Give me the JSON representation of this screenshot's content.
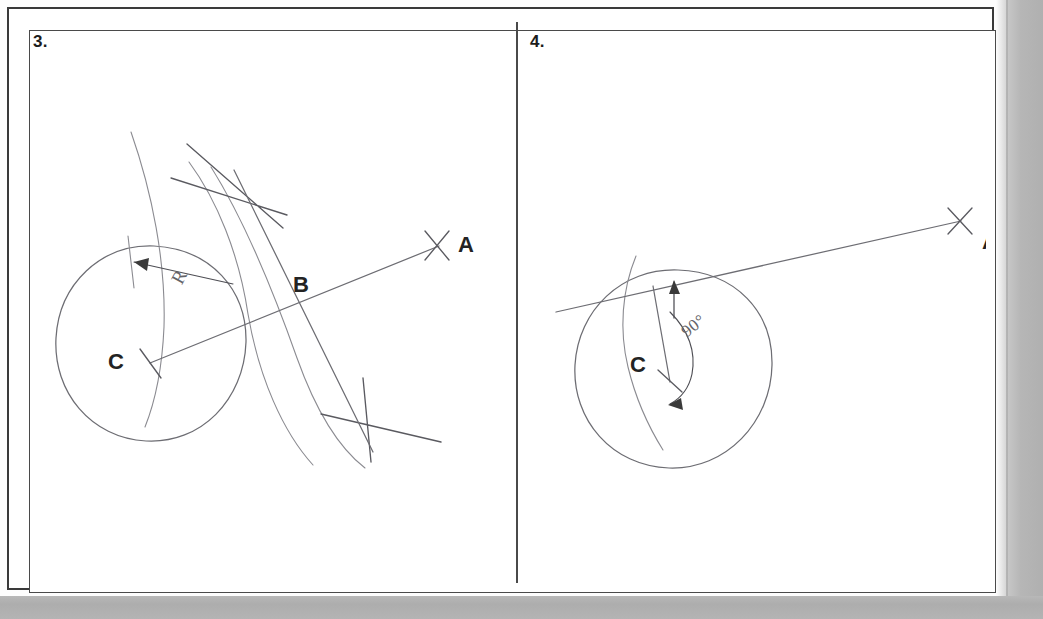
{
  "document": {
    "type": "technical-drawing-worksheet",
    "title": "Tangent line construction from external point to circle",
    "ink_color": "#6d6d73",
    "label_color": "#232323",
    "frame_color": "#3a3a3a",
    "page_background": "#fdfdfd",
    "scanner_bed_color": "#b4b4b4"
  },
  "panels": [
    {
      "id": "panel-3",
      "number": "3.",
      "labels": {
        "point_a": "A",
        "point_b": "B",
        "point_c": "C",
        "radius": "R"
      },
      "geometry": {
        "circle": {
          "cx": 150,
          "cy": 342,
          "r": 96
        },
        "point_a": {
          "x": 418,
          "y": 224
        },
        "point_b": {
          "x": 289,
          "y": 284
        },
        "point_c": {
          "x": 150,
          "y": 342
        },
        "arc_intersection_upper": {
          "x": 225,
          "y": 168
        },
        "arc_intersection_lower": {
          "x": 357,
          "y": 406
        }
      },
      "annotations": [
        {
          "name": "radius-dimension",
          "text": "R",
          "x": 178,
          "y": 258
        }
      ]
    },
    {
      "id": "panel-4",
      "number": "4.",
      "labels": {
        "point_a": "A",
        "point_c": "C",
        "angle": "90°"
      },
      "geometry": {
        "circle": {
          "cx": 672,
          "cy": 365,
          "r": 100
        },
        "point_a": {
          "x": 961,
          "y": 221
        },
        "point_c": {
          "x": 672,
          "y": 365
        },
        "tangent_point": {
          "x": 655,
          "y": 286
        }
      },
      "annotations": [
        {
          "name": "right-angle-dimension",
          "text": "90°",
          "x": 688,
          "y": 310
        }
      ]
    }
  ]
}
